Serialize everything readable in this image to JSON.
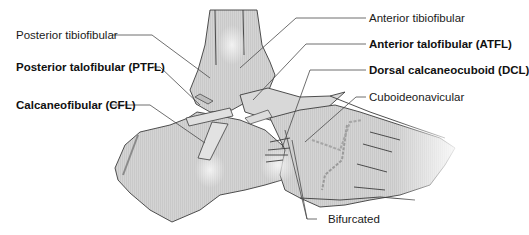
{
  "figure": {
    "colors": {
      "bone_fill": "#d2d2d2",
      "bone_fill_light": "#e4e4e4",
      "outline": "#3c3c3c",
      "leader": "#4a4a4a",
      "text": "#1a1a1a"
    }
  },
  "labels": {
    "posterior_tibiofibular": "Posterior tibiofibular",
    "posterior_talofibular": "Posterior talofibular (PTFL)",
    "calcaneofibular": "Calcaneofibular (CFL)",
    "anterior_tibiofibular": "Anterior tibiofibular",
    "anterior_talofibular": "Anterior talofibular (ATFL)",
    "dorsal_calcaneocuboid": "Dorsal calcaneocuboid (DCL)",
    "cuboideonavicular": "Cuboideonavicular",
    "bifurcated": "Bifurcated"
  }
}
